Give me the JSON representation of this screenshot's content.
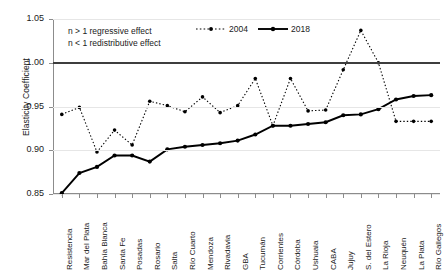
{
  "chart_data": {
    "type": "line",
    "title": "",
    "xlabel": "",
    "ylabel": "Elasticity Coefficient",
    "ylim": [
      0.85,
      1.05
    ],
    "yticks": [
      "0.85",
      "0.90",
      "0.95",
      "1.00",
      "1.05"
    ],
    "grid": true,
    "reference_line": 1.0,
    "legend_position": "top-center",
    "categories": [
      "Resistencia",
      "Mar del Plata",
      "Bahía Blanca",
      "Santa Fe",
      "Posadas",
      "Rosario",
      "Salta",
      "Río Cuarto",
      "Mendoza",
      "Rivadavia",
      "GBA",
      "Tucumán",
      "Corrientes",
      "Córdoba",
      "Ushuaia",
      "CABA",
      "Jujuy",
      "S. del Estero",
      "La Rioja",
      "Neuquén",
      "La Plata",
      "Río Gallegos"
    ],
    "series": [
      {
        "name": "2004",
        "style": "dotted",
        "values": [
          0.941,
          0.949,
          0.898,
          0.923,
          0.906,
          0.956,
          0.951,
          0.944,
          0.961,
          0.943,
          0.951,
          0.982,
          0.928,
          0.982,
          0.945,
          0.946,
          0.992,
          1.037,
          1.0,
          0.933,
          0.933,
          0.933
        ]
      },
      {
        "name": "2018",
        "style": "solid",
        "values": [
          0.851,
          0.874,
          0.881,
          0.894,
          0.894,
          0.887,
          0.901,
          0.904,
          0.906,
          0.908,
          0.911,
          0.918,
          0.928,
          0.928,
          0.93,
          0.932,
          0.94,
          0.941,
          0.947,
          0.958,
          0.962,
          0.963
        ]
      }
    ],
    "annotations": [
      "n > 1 regressive effect",
      "n < 1 redistributive effect"
    ],
    "colors": {
      "series_2004": "#000000",
      "series_2018": "#000000",
      "reference_line": "#3d3d3d",
      "grid": "#e6e6e6",
      "axis": "#8c8c8c"
    }
  },
  "legend": {
    "items": [
      {
        "label": "2004"
      },
      {
        "label": "2018"
      }
    ]
  },
  "notes": {
    "line1": "n > 1 regressive effect",
    "line2": "n < 1 redistributive effect"
  },
  "axes": {
    "y_title": "Elasticity Coefficient"
  }
}
